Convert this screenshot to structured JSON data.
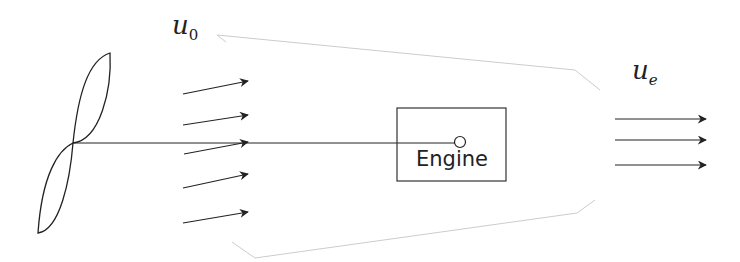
{
  "diagram": {
    "labels": {
      "inlet_velocity_main": "u",
      "inlet_velocity_sub": "0",
      "exit_velocity_main": "u",
      "exit_velocity_sub": "e",
      "engine": "Engine"
    },
    "components": [
      "propeller",
      "inlet-flow-arrows",
      "shaft",
      "engine-box",
      "flow-tube-outline",
      "exit-flow-arrows"
    ],
    "colors": {
      "stroke": "#222222",
      "outline": "#cfcfcf",
      "background": "#ffffff"
    }
  }
}
